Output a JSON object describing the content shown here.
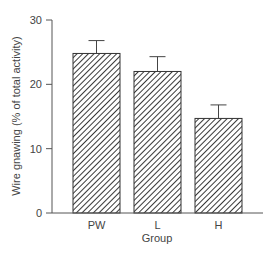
{
  "chart_data": {
    "type": "bar",
    "title": "",
    "xlabel": "Group",
    "ylabel": "Wire gnawing (% of total activity)",
    "categories": [
      "PW",
      "L",
      "H"
    ],
    "values": [
      24.8,
      22.0,
      14.7
    ],
    "error_upper": [
      2.0,
      2.3,
      2.1
    ],
    "ylim": [
      0,
      30
    ],
    "yticks": [
      0,
      10,
      20,
      30
    ],
    "grid": false,
    "legend": null,
    "bar_fill": "diagonal-hatch",
    "colors": {
      "axis": "#555555",
      "hatch": "#222222",
      "bar_bg": "#ffffff",
      "text": "#444444"
    }
  }
}
